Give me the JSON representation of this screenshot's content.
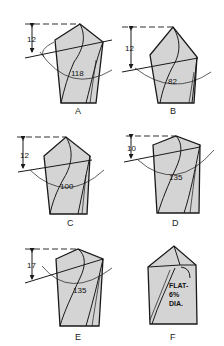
{
  "figures": [
    {
      "id": "A",
      "label": "A",
      "point_angle": "118",
      "lip_clearance": "12"
    },
    {
      "id": "B",
      "label": "B",
      "point_angle": "82",
      "lip_clearance": "12"
    },
    {
      "id": "C",
      "label": "C",
      "point_angle": "100",
      "lip_clearance": "12"
    },
    {
      "id": "D",
      "label": "D",
      "point_angle": "135",
      "lip_clearance": "10"
    },
    {
      "id": "E",
      "label": "E",
      "point_angle": "135",
      "lip_clearance": "17"
    },
    {
      "id": "F",
      "label": "F",
      "note_line1": "FLAT-",
      "note_line2": "6%",
      "note_line3": "DIA."
    }
  ],
  "colors": {
    "drill_fill": "#d4d4d4",
    "ink": "#1a1a1a",
    "background": "#ffffff"
  }
}
